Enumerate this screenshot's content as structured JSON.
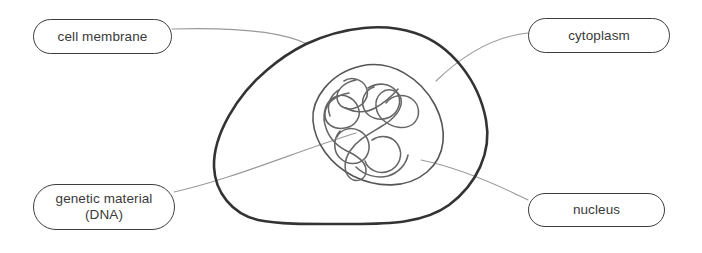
{
  "diagram": {
    "background_color": "#ffffff",
    "labels": {
      "cell_membrane": "cell membrane",
      "cytoplasm": "cytoplasm",
      "genetic_material": "genetic material\n(DNA)",
      "nucleus": "nucleus"
    },
    "colors": {
      "membrane_stroke": "#333333",
      "nucleus_stroke": "#555555",
      "dna_stroke": "#666666",
      "leader_stroke": "#9a9a9a",
      "pill_border": "#3c3c3c",
      "text": "#3a3a3a"
    },
    "parts": [
      {
        "name": "cell membrane",
        "shape": "outer irregular blob",
        "stroke_width": 2.6
      },
      {
        "name": "nucleus",
        "shape": "tilted egg outline",
        "stroke_width": 1.6
      },
      {
        "name": "genetic material (DNA)",
        "shape": "tangled loops",
        "stroke_width": 1.6
      },
      {
        "name": "cytoplasm",
        "shape": "region between membrane and nucleus",
        "stroke_width": 0
      }
    ]
  }
}
